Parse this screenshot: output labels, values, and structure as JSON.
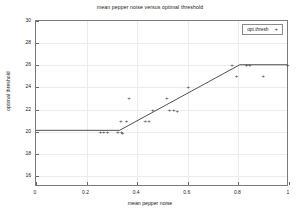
{
  "chart_data": {
    "type": "scatter",
    "title": "mean pepper noise versus optimal threshold",
    "xlabel": "mean pepper noise",
    "ylabel": "optimal threshold",
    "xlim": [
      0,
      1
    ],
    "ylim": [
      15,
      30
    ],
    "xticks": [
      "0",
      "0.2",
      "0.4",
      "0.6",
      "0.8",
      "1"
    ],
    "xtick_values": [
      0,
      0.2,
      0.4,
      0.6,
      0.8,
      1
    ],
    "yticks": [
      "16",
      "18",
      "20",
      "22",
      "24",
      "26",
      "28",
      "30"
    ],
    "ytick_values": [
      16,
      18,
      20,
      22,
      24,
      26,
      28,
      30
    ],
    "grid": true,
    "legend_position": "top-right",
    "marker": "+",
    "marker_color": "#3a3a3a",
    "line_color": "#3a3a3a",
    "series": [
      {
        "name": "opt.thresh",
        "marker_symbol": "+",
        "points": [
          {
            "x": 0.255,
            "y": 20
          },
          {
            "x": 0.268,
            "y": 20
          },
          {
            "x": 0.283,
            "y": 20
          },
          {
            "x": 0.323,
            "y": 20
          },
          {
            "x": 0.335,
            "y": 21
          },
          {
            "x": 0.338,
            "y": 20
          },
          {
            "x": 0.342,
            "y": 19.85
          },
          {
            "x": 0.358,
            "y": 21
          },
          {
            "x": 0.368,
            "y": 23
          },
          {
            "x": 0.432,
            "y": 21
          },
          {
            "x": 0.447,
            "y": 21
          },
          {
            "x": 0.462,
            "y": 22
          },
          {
            "x": 0.517,
            "y": 23
          },
          {
            "x": 0.528,
            "y": 22
          },
          {
            "x": 0.545,
            "y": 22
          },
          {
            "x": 0.558,
            "y": 21.9
          },
          {
            "x": 0.602,
            "y": 24
          },
          {
            "x": 0.775,
            "y": 26
          },
          {
            "x": 0.793,
            "y": 25
          },
          {
            "x": 0.832,
            "y": 26
          },
          {
            "x": 0.845,
            "y": 26
          },
          {
            "x": 0.898,
            "y": 25
          },
          {
            "x": 0.995,
            "y": 26
          }
        ]
      }
    ],
    "fit_line": {
      "name": "piecewise-linear fit",
      "vertices": [
        {
          "x": 0.0,
          "y": 20
        },
        {
          "x": 0.333,
          "y": 20
        },
        {
          "x": 0.812,
          "y": 26
        },
        {
          "x": 1.0,
          "y": 26
        }
      ]
    }
  },
  "legend": {
    "entries": [
      {
        "label": "opt.thresh",
        "symbol": "+"
      }
    ]
  }
}
